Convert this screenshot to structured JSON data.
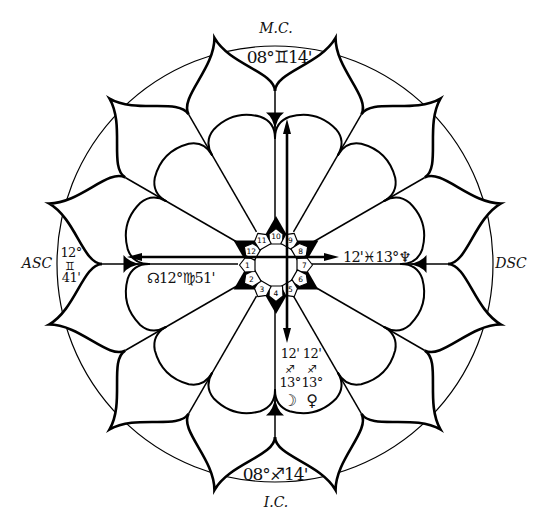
{
  "angles": {
    "mc": {
      "label": "M.C.",
      "degree": "08°",
      "sign": "♊",
      "minute": "14'"
    },
    "ic": {
      "label": "I.C.",
      "degree": "08°",
      "sign": "♐",
      "minute": "14'"
    },
    "asc": {
      "label": "ASC",
      "degree": "12°",
      "sign": "♊",
      "minute": "41'"
    },
    "dsc": {
      "label": "DSC"
    }
  },
  "houses": [
    "1",
    "2",
    "3",
    "4",
    "5",
    "6",
    "7",
    "8",
    "9",
    "10",
    "11",
    "12"
  ],
  "placements": {
    "neptune": {
      "glyph": "♆",
      "degree": "13°",
      "sign": "♓",
      "minute": "12'"
    },
    "north_node": {
      "glyph": "☊",
      "degree": "12°",
      "sign": "♍",
      "minute": "51'"
    },
    "moon": {
      "glyph": "☽",
      "degree": "13°",
      "sign": "♐",
      "minute": "12'"
    },
    "venus": {
      "glyph": "♀",
      "degree": "13°",
      "sign": "♐",
      "minute": "12'"
    }
  },
  "colors": {
    "ink": "#000000",
    "background": "#ffffff"
  }
}
